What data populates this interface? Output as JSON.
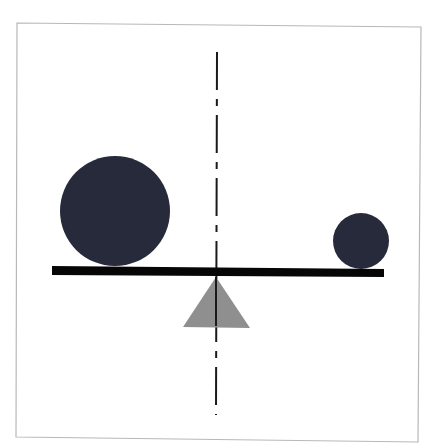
{
  "diagram": {
    "type": "balance-lever",
    "colors": {
      "background": "#ffffff",
      "frame": "#b8b8b8",
      "mass": "#272a3a",
      "beam": "#060606",
      "fulcrum": "#8f8f8f",
      "axis": "#1a1a1a"
    },
    "frame": {
      "points": [
        [
          17,
          23
        ],
        [
          421,
          27
        ],
        [
          418,
          442
        ],
        [
          16,
          437
        ]
      ]
    },
    "axis": {
      "x1": 217,
      "y1": 52,
      "x2": 216,
      "y2": 415,
      "dasharray": "38 9 7 9",
      "width": 2
    },
    "beam": {
      "points": [
        [
          52,
          266
        ],
        [
          384,
          269
        ],
        [
          384,
          277
        ],
        [
          52,
          275
        ]
      ]
    },
    "fulcrum": {
      "points": [
        [
          216,
          277
        ],
        [
          250,
          328
        ],
        [
          183,
          327
        ]
      ]
    },
    "masses": [
      {
        "name": "large-mass",
        "cx": 115,
        "cy": 211,
        "r": 55
      },
      {
        "name": "small-mass",
        "cx": 361,
        "cy": 241,
        "r": 28
      }
    ]
  }
}
